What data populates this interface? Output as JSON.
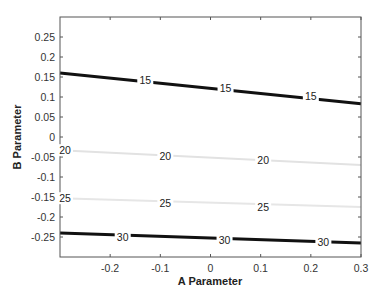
{
  "chart_data": {
    "type": "contour",
    "title": "",
    "xlabel": "A Parameter",
    "ylabel": "B Parameter",
    "xlim": [
      -0.3,
      0.3
    ],
    "ylim": [
      -0.3,
      0.3
    ],
    "grid": false,
    "legend": null,
    "x_ticks": [
      -0.2,
      -0.1,
      0,
      0.1,
      0.2,
      0.3
    ],
    "x_tick_labels": [
      "-0.2",
      "-0.1",
      "0",
      "0.1",
      "0.2",
      "0.3"
    ],
    "y_ticks": [
      0.25,
      0.2,
      0.15,
      0.1,
      0.05,
      0,
      -0.05,
      -0.1,
      -0.15,
      -0.2,
      -0.25
    ],
    "y_tick_labels": [
      "0.25",
      "0.2",
      "0.15",
      "0.1",
      "0.05",
      "0",
      "-0.05",
      "-0.1",
      "-0.15",
      "-0.2",
      "-0.25"
    ],
    "contours": [
      {
        "level": 15,
        "color": "#111111",
        "width": 3,
        "points": [
          [
            -0.3,
            0.16
          ],
          [
            0.3,
            0.083
          ]
        ],
        "labels": [
          [
            -0.13,
            0.142
          ],
          [
            0.03,
            0.122
          ],
          [
            0.2,
            0.103
          ]
        ]
      },
      {
        "level": 20,
        "color": "#e2e2e2",
        "width": 2,
        "points": [
          [
            -0.3,
            -0.033
          ],
          [
            0.3,
            -0.07
          ]
        ],
        "labels": [
          [
            -0.29,
            -0.033
          ],
          [
            -0.09,
            -0.047
          ],
          [
            0.105,
            -0.058
          ]
        ]
      },
      {
        "level": 25,
        "color": "#e6e6e6",
        "width": 2,
        "points": [
          [
            -0.3,
            -0.153
          ],
          [
            0.3,
            -0.175
          ]
        ],
        "labels": [
          [
            -0.29,
            -0.153
          ],
          [
            -0.09,
            -0.164
          ],
          [
            0.105,
            -0.175
          ]
        ]
      },
      {
        "level": 30,
        "color": "#111111",
        "width": 3,
        "points": [
          [
            -0.3,
            -0.24
          ],
          [
            0.3,
            -0.265
          ]
        ],
        "labels": [
          [
            -0.175,
            -0.25
          ],
          [
            0.028,
            -0.257
          ],
          [
            0.225,
            -0.263
          ]
        ]
      }
    ]
  }
}
